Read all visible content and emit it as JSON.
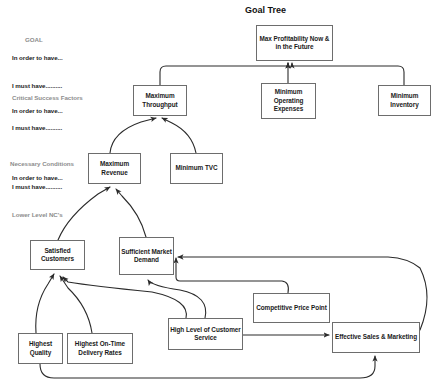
{
  "diagram": {
    "title": "Goal Tree",
    "title_pos": {
      "x": 245,
      "y": 5
    },
    "colors": {
      "box_border": "#6d6d6d",
      "box_fill": "#ffffff",
      "text": "#1a1a1a",
      "annotation_grey": "#8d8d8d",
      "connector": "#2b2b2b",
      "background": "#ffffff"
    },
    "annotations": [
      {
        "id": "goal-label",
        "text": "GOAL",
        "x": 25,
        "y": 36,
        "grey": true
      },
      {
        "id": "goal-in-order",
        "text": "In order to have...",
        "x": 12,
        "y": 54,
        "grey": false
      },
      {
        "id": "goal-i-must-have",
        "text": "I must have..........",
        "x": 12,
        "y": 82,
        "grey": false
      },
      {
        "id": "csf-label",
        "text": "Critical Success Factors",
        "x": 12,
        "y": 94,
        "grey": true
      },
      {
        "id": "csf-in-order",
        "text": "In order to have...",
        "x": 12,
        "y": 107,
        "grey": false
      },
      {
        "id": "csf-i-must-have",
        "text": "I must have..........",
        "x": 12,
        "y": 124,
        "grey": false
      },
      {
        "id": "nc-label",
        "text": "Necessary Conditions",
        "x": 10,
        "y": 160,
        "grey": true
      },
      {
        "id": "nc-in-order",
        "text": "In order to have...",
        "x": 12,
        "y": 174,
        "grey": false
      },
      {
        "id": "nc-i-must-have",
        "text": "I must have..........",
        "x": 12,
        "y": 183,
        "grey": false
      },
      {
        "id": "lower-nc-label",
        "text": "Lower Level NC's",
        "x": 12,
        "y": 211,
        "grey": true
      }
    ],
    "nodes": [
      {
        "id": "max-profitability",
        "label": "Max Profitability Now & in the Future",
        "x": 256,
        "y": 25,
        "w": 77,
        "h": 36
      },
      {
        "id": "maximum-throughput",
        "label": "Maximum Throughput",
        "x": 133,
        "y": 85,
        "w": 54,
        "h": 31
      },
      {
        "id": "minimum-operating-expenses",
        "label": "Minimum Operating Expenses",
        "x": 261,
        "y": 83,
        "w": 55,
        "h": 36
      },
      {
        "id": "minimum-inventory",
        "label": "Minimum Inventory",
        "x": 378,
        "y": 85,
        "w": 53,
        "h": 31
      },
      {
        "id": "maximum-revenue",
        "label": "Maximum Revenue",
        "x": 88,
        "y": 153,
        "w": 53,
        "h": 31
      },
      {
        "id": "minimum-tvc",
        "label": "Minimum TVC",
        "x": 170,
        "y": 153,
        "w": 53,
        "h": 31
      },
      {
        "id": "satisfied-customers",
        "label": "Satisfied Customers",
        "x": 30,
        "y": 240,
        "w": 55,
        "h": 30
      },
      {
        "id": "sufficient-market-demand",
        "label": "Sufficient Market Demand",
        "x": 119,
        "y": 237,
        "w": 55,
        "h": 38
      },
      {
        "id": "competitive-price-point",
        "label": "Competitive Price Point",
        "x": 253,
        "y": 293,
        "w": 77,
        "h": 30
      },
      {
        "id": "highest-quality",
        "label": "Highest Quality",
        "x": 18,
        "y": 333,
        "w": 45,
        "h": 31
      },
      {
        "id": "highest-on-time-delivery-rates",
        "label": "Highest On-Time Delivery Rates",
        "x": 67,
        "y": 333,
        "w": 66,
        "h": 31
      },
      {
        "id": "high-level-of-customer-service",
        "label": "High Level of Customer Service",
        "x": 168,
        "y": 318,
        "w": 75,
        "h": 32
      },
      {
        "id": "effective-sales-marketing",
        "label": "Effective Sales & Marketing",
        "x": 332,
        "y": 322,
        "w": 88,
        "h": 31
      }
    ],
    "edges": [
      {
        "id": "edge-throughput-to-profitability",
        "from": "maximum-throughput",
        "to": "max-profitability"
      },
      {
        "id": "edge-opex-to-profitability",
        "from": "minimum-operating-expenses",
        "to": "max-profitability"
      },
      {
        "id": "edge-inventory-to-profitability",
        "from": "minimum-inventory",
        "to": "max-profitability"
      },
      {
        "id": "edge-revenue-to-throughput",
        "from": "maximum-revenue",
        "to": "maximum-throughput"
      },
      {
        "id": "edge-tvc-to-throughput",
        "from": "minimum-tvc",
        "to": "maximum-throughput"
      },
      {
        "id": "edge-satisfied-to-revenue",
        "from": "satisfied-customers",
        "to": "maximum-revenue"
      },
      {
        "id": "edge-demand-to-revenue",
        "from": "sufficient-market-demand",
        "to": "maximum-revenue"
      },
      {
        "id": "edge-quality-to-satisfied",
        "from": "highest-quality",
        "to": "satisfied-customers"
      },
      {
        "id": "edge-delivery-to-satisfied",
        "from": "highest-on-time-delivery-rates",
        "to": "satisfied-customers"
      },
      {
        "id": "edge-service-to-satisfied",
        "from": "high-level-of-customer-service",
        "to": "satisfied-customers"
      },
      {
        "id": "edge-service-to-demand",
        "from": "high-level-of-customer-service",
        "to": "sufficient-market-demand"
      },
      {
        "id": "edge-price-to-demand",
        "from": "competitive-price-point",
        "to": "sufficient-market-demand"
      },
      {
        "id": "edge-sales-to-demand",
        "from": "effective-sales-marketing",
        "to": "sufficient-market-demand"
      },
      {
        "id": "edge-sales-to-demand-bottom",
        "from": "effective-sales-marketing",
        "to": "sufficient-market-demand"
      },
      {
        "id": "edge-service-to-sales",
        "from": "high-level-of-customer-service",
        "to": "effective-sales-marketing"
      },
      {
        "id": "edge-quality-to-sales",
        "from": "highest-quality",
        "to": "effective-sales-marketing"
      }
    ]
  }
}
